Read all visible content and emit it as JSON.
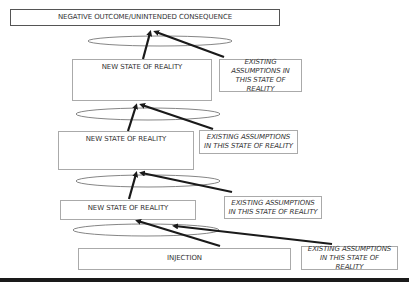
{
  "diagram": {
    "top_box": {
      "label": "NEGATIVE OUTCOME/UNINTENDED CONSEQUENCE"
    },
    "levels": [
      {
        "state_label": "NEW STATE OF REALITY",
        "assumption_label": "EXISTING ASSUMPTIONS IN THIS STATE OF REALITY"
      },
      {
        "state_label": "NEW STATE OF REALITY",
        "assumption_label": "EXISTING ASSUMPTIONS IN THIS STATE OF REALITY"
      },
      {
        "state_label": "NEW STATE OF REALITY",
        "assumption_label": "EXISTING ASSUMPTIONS IN THIS STATE OF REALITY"
      }
    ],
    "injection_box": {
      "label": "INJECTION",
      "assumption_label": "EXISTING ASSUMPTIONS IN THIS STATE OF REALITY"
    },
    "colors": {
      "arrow": "#1a1a1a",
      "box_border": "#aaaaaa",
      "top_box_border": "#555555",
      "ellipse": "#666666",
      "bottom_band": "#1a1a1a"
    }
  }
}
